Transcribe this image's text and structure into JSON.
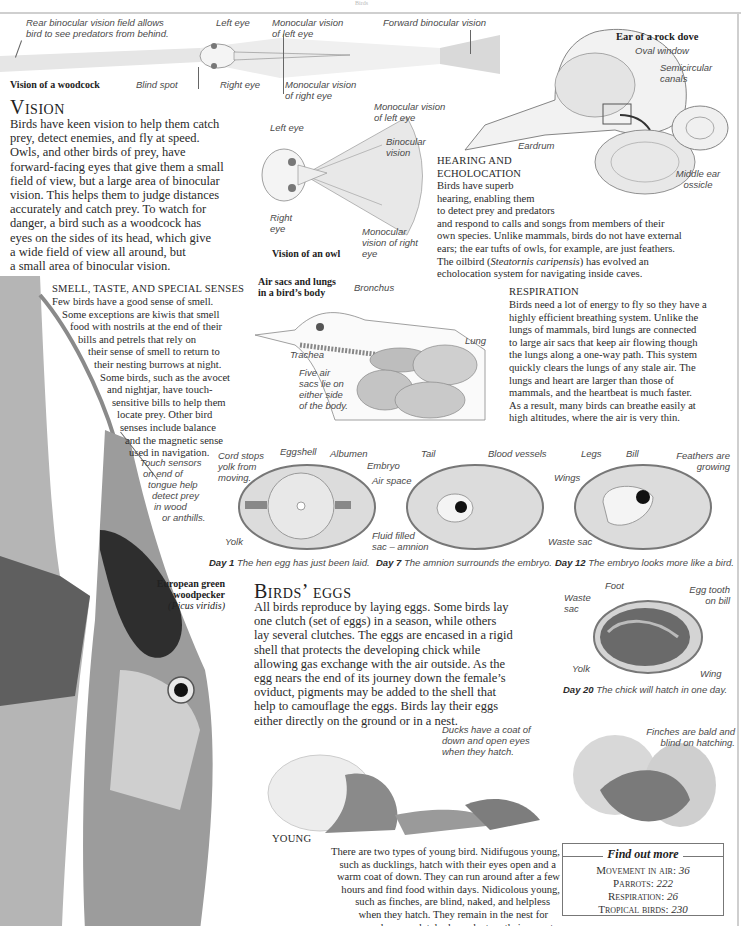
{
  "page": {
    "runner": "Birds",
    "accent_colors": {
      "text": "#2a2a2a",
      "label": "#4a4a4a",
      "frame": "#cfcfcf"
    }
  },
  "woodcock_diagram": {
    "caption": "Vision of a woodcock",
    "labels": {
      "rear_binocular": "Rear binocular vision field allows bird to see predators from behind.",
      "left_eye": "Left eye",
      "mono_left": "Monocular vision of left eye",
      "forward_binocular": "Forward binocular vision",
      "blind_spot": "Blind spot",
      "right_eye": "Right eye",
      "mono_right": "Monocular vision of right eye"
    }
  },
  "vision": {
    "heading": "Vision",
    "lines": [
      "Birds have keen vision to help them catch",
      "prey, detect enemies, and fly at speed.",
      "Owls, and other birds of prey, have",
      "forward-facing eyes that give them a small",
      "field of view, but a large area of binocular",
      "vision. This helps them to judge distances",
      "accurately and catch prey. To watch for",
      "danger, a bird such as a woodcock has",
      "eyes on the sides of its head, which give",
      "a wide field of view all around, but",
      "a small area of binocular vision."
    ]
  },
  "owl_diagram": {
    "caption": "Vision of an owl",
    "labels": {
      "left_eye": "Left eye",
      "mono_left": "Monocular vision of left eye",
      "binocular": "Binocular vision",
      "right_eye": "Right eye",
      "mono_right": "Monocular vision of right eye"
    }
  },
  "ear_diagram": {
    "caption": "Ear of a rock dove",
    "labels": {
      "oval_window": "Oval window",
      "semicircular": "Semicircular canals",
      "eardrum": "Eardrum",
      "middle_ear": "Middle ear ossicle"
    }
  },
  "hearing": {
    "heading_1": "HEARING AND",
    "heading_2": "ECHOLOCATION",
    "lines": [
      "Birds have superb",
      "hearing, enabling them",
      "to detect prey and predators",
      "and respond to calls and songs from members of their",
      "own species. Unlike mammals, birds do not have external",
      "ears; the ear tufts of owls, for example, are just feathers."
    ],
    "oilbird_pre": "The oilbird (",
    "oilbird_latin": "Steatornis caripensis",
    "oilbird_post": ") has evolved an",
    "last_line": "echolocation system for navigating inside caves."
  },
  "senses": {
    "heading": "SMELL, TASTE, AND SPECIAL SENSES",
    "lines": [
      "Few birds have a good sense of smell.",
      "Some exceptions are kiwis that smell",
      "food with nostrils at the end of their",
      "bills and petrels that rely on",
      "their sense of smell to return to",
      "their nesting burrows at night.",
      "Some birds, such as the avocet",
      "and nightjar, have touch-",
      "sensitive bills to help them",
      "locate prey. Other bird",
      "senses include balance",
      "and the magnetic sense",
      "used in navigation."
    ],
    "tongue_label": [
      "Touch sensors",
      "on end of",
      "tongue help",
      "detect prey",
      "in wood",
      "or anthills."
    ]
  },
  "airsacs_diagram": {
    "caption_1": "Air sacs and lungs",
    "caption_2": "in a bird’s body",
    "labels": {
      "bronchus": "Bronchus",
      "lung": "Lung",
      "trachea": "Trachea",
      "five_sacs": [
        "Five air",
        "sacs lie on",
        "either side",
        "of the body."
      ]
    }
  },
  "respiration": {
    "heading": "RESPIRATION",
    "lines": [
      "Birds need a lot of energy to fly so they have a",
      "highly efficient breathing system. Unlike the",
      "lungs of mammals, bird lungs are connected",
      "to large air sacs that keep air flowing though",
      "the lungs along a one-way path. This system",
      "quickly clears the lungs of any stale air. The",
      "lungs and heart are larger than those of",
      "mammals, and the heartbeat is much faster.",
      "As a result, many birds can breathe easily at",
      "high altitudes, where the air is very thin."
    ]
  },
  "eggs_diagrams": {
    "day1": {
      "day": "Day 1",
      "caption": "The hen egg has just been laid.",
      "labels": {
        "cord": [
          "Cord stops",
          "yolk from",
          "moving."
        ],
        "eggshell": "Eggshell",
        "albumen": "Albumen",
        "embryo": "Embryo",
        "air_space": "Air space",
        "yolk": "Yolk"
      }
    },
    "day7": {
      "day": "Day 7",
      "caption": "The amnion surrounds the embryo.",
      "labels": {
        "tail": "Tail",
        "blood_vessels": "Blood vessels",
        "fluid": [
          "Fluid filled",
          "sac – amnion"
        ]
      }
    },
    "day12": {
      "day": "Day 12",
      "caption": "The embryo looks more like a bird.",
      "labels": {
        "legs": "Legs",
        "bill": "Bill",
        "feathers": [
          "Feathers are",
          "growing"
        ],
        "wings": "Wings",
        "waste_sac": "Waste sac"
      }
    },
    "day20": {
      "day": "Day 20",
      "caption": "The chick will hatch in one day.",
      "labels": {
        "waste": [
          "Waste",
          "sac"
        ],
        "foot": "Foot",
        "egg_tooth": [
          "Egg tooth",
          "on bill"
        ],
        "yolk": "Yolk",
        "wing": "Wing"
      }
    }
  },
  "woodpecker": {
    "name_1": "European green",
    "name_2": "woodpecker",
    "latin": "(Picus viridis)"
  },
  "birds_eggs": {
    "heading": "Birds’ eggs",
    "lines": [
      "All birds reproduce by laying eggs. Some birds lay",
      "one clutch (set of eggs) in a season, while others",
      "lay several clutches. The eggs are encased in a rigid",
      "shell that protects the developing chick while",
      "allowing gas exchange with the air outside. As the",
      "egg nears the end of its journey down the female’s",
      "oviduct, pigments may be added to the shell that",
      "help to camouflage the eggs. Birds lay their eggs",
      "either directly on the ground or in a nest."
    ]
  },
  "hatchlings": {
    "finches_label": [
      "Finches are bald and",
      "blind on hatching."
    ],
    "ducks_label": [
      "Ducks have a coat of",
      "down and open eyes",
      "when they hatch."
    ]
  },
  "young": {
    "heading": "YOUNG",
    "lines": [
      "There are two types of young bird. Nidifugous young,",
      "such as ducklings, hatch with their eyes open and a",
      "warm coat of down. They can run around after a few",
      "hours and find food within days. Nidicolous young,",
      "such as finches, are blind, naked, and helpless",
      "when they hatch. They remain in the nest for",
      "weeks, completely dependent on their parents."
    ]
  },
  "find_out_more": {
    "title": "Find out more",
    "items": [
      {
        "label": "Movement in air:",
        "page": "36"
      },
      {
        "label": "Parrots:",
        "page": "222"
      },
      {
        "label": "Respiration:",
        "page": "26"
      },
      {
        "label": "Tropical birds:",
        "page": "230"
      }
    ]
  }
}
